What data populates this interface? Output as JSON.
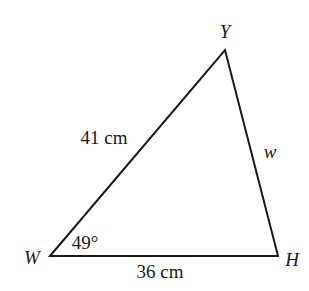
{
  "diagram": {
    "type": "triangle",
    "vertices": {
      "W": {
        "label": "W"
      },
      "Y": {
        "label": "Y"
      },
      "H": {
        "label": "H"
      }
    },
    "sides": {
      "WY": {
        "label": "41 cm"
      },
      "YH": {
        "label": "w"
      },
      "WH": {
        "label": "36 cm"
      }
    },
    "angles": {
      "W": {
        "label": "49°"
      }
    },
    "colors": {
      "stroke": "#1a1a1a",
      "background": "#ffffff"
    }
  }
}
